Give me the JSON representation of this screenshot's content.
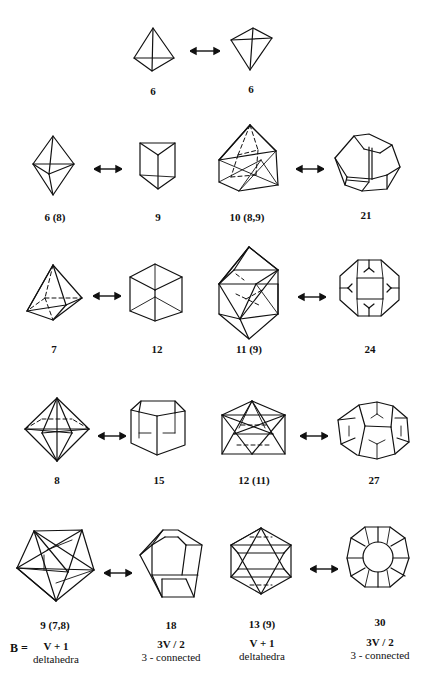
{
  "rows": [
    {
      "left": {
        "label": "6"
      },
      "right": {
        "label": "6"
      }
    },
    {
      "pairs": [
        {
          "delta": {
            "label": "6 (8)"
          },
          "dual": {
            "label": "9"
          }
        },
        {
          "delta": {
            "label": "10 (8,9)"
          },
          "dual": {
            "label": "21"
          }
        }
      ]
    },
    {
      "pairs": [
        {
          "delta": {
            "label": "7"
          },
          "dual": {
            "label": "12"
          }
        },
        {
          "delta": {
            "label": "11 (9)"
          },
          "dual": {
            "label": "24"
          }
        }
      ]
    },
    {
      "pairs": [
        {
          "delta": {
            "label": "8"
          },
          "dual": {
            "label": "15"
          }
        },
        {
          "delta": {
            "label": "12 (11)"
          },
          "dual": {
            "label": "27"
          }
        }
      ]
    },
    {
      "pairs": [
        {
          "delta": {
            "label": "9 (7,8)"
          },
          "dual": {
            "label": "18"
          }
        },
        {
          "delta": {
            "label": "13 (9)"
          },
          "dual": {
            "label": "30"
          }
        }
      ]
    }
  ],
  "footer": {
    "b_label": "B =",
    "columns": [
      {
        "formula": "V + 1",
        "type": "deltahedra"
      },
      {
        "formula": "3V / 2",
        "type": "3 - connected"
      },
      {
        "formula": "V + 1",
        "type": "deltahedra"
      },
      {
        "formula": "3V / 2",
        "type": "3 - connected"
      }
    ]
  },
  "arrow_icon": "double-headed-arrow-icon"
}
